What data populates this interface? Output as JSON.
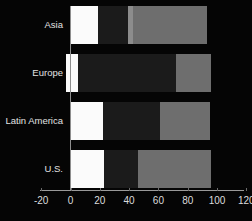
{
  "chart_data": {
    "type": "bar",
    "orientation": "horizontal",
    "stacked": true,
    "title": "",
    "xlabel": "",
    "ylabel": "",
    "categories": [
      "Asia",
      "Europe",
      "Latin America",
      "U.S."
    ],
    "xlim": [
      -20,
      120
    ],
    "xticks": [
      -20,
      0,
      20,
      40,
      60,
      80,
      100,
      120
    ],
    "xtick_labels": [
      "-20",
      "0",
      "20",
      "40",
      "60",
      "80",
      "100",
      "120"
    ],
    "grid": false,
    "legend": "none",
    "background": "#000000",
    "series": [
      {
        "name": "segment-1",
        "color": "#fbfbfb",
        "values": [
          19,
          5,
          22,
          23
        ]
      },
      {
        "name": "segment-2",
        "color": "#1b1b1b",
        "values": [
          20,
          67,
          39,
          23
        ]
      },
      {
        "name": "segment-3",
        "color": "#8c8c8c",
        "values": [
          4,
          0,
          0,
          0
        ]
      },
      {
        "name": "segment-4",
        "color": "#6e6e6e",
        "values": [
          50,
          24,
          34,
          50
        ]
      }
    ],
    "bars": [
      {
        "category": "Asia",
        "start": 0,
        "total": 93,
        "segments": [
          {
            "name": "white",
            "start": 0,
            "end": 19,
            "color": "#fbfbfb"
          },
          {
            "name": "dark",
            "start": 19,
            "end": 39,
            "color": "#1b1b1b"
          },
          {
            "name": "light-gray",
            "start": 39,
            "end": 43,
            "color": "#8c8c8c"
          },
          {
            "name": "gray",
            "start": 43,
            "end": 93,
            "color": "#6e6e6e"
          }
        ]
      },
      {
        "category": "Europe",
        "start": -3,
        "total": 96,
        "segments": [
          {
            "name": "white",
            "start": -3,
            "end": 5,
            "color": "#fbfbfb"
          },
          {
            "name": "dark",
            "start": 5,
            "end": 72,
            "color": "#1b1b1b"
          },
          {
            "name": "gray",
            "start": 72,
            "end": 96,
            "color": "#6e6e6e"
          }
        ]
      },
      {
        "category": "Latin America",
        "start": 0,
        "total": 95,
        "segments": [
          {
            "name": "white",
            "start": 0,
            "end": 22,
            "color": "#fbfbfb"
          },
          {
            "name": "dark",
            "start": 22,
            "end": 61,
            "color": "#1b1b1b"
          },
          {
            "name": "gray",
            "start": 61,
            "end": 95,
            "color": "#6e6e6e"
          }
        ]
      },
      {
        "category": "U.S.",
        "start": 0,
        "total": 96,
        "segments": [
          {
            "name": "white",
            "start": 0,
            "end": 23,
            "color": "#fbfbfb"
          },
          {
            "name": "dark",
            "start": 23,
            "end": 46,
            "color": "#1b1b1b"
          },
          {
            "name": "gray",
            "start": 46,
            "end": 96,
            "color": "#6e6e6e"
          }
        ]
      }
    ]
  }
}
